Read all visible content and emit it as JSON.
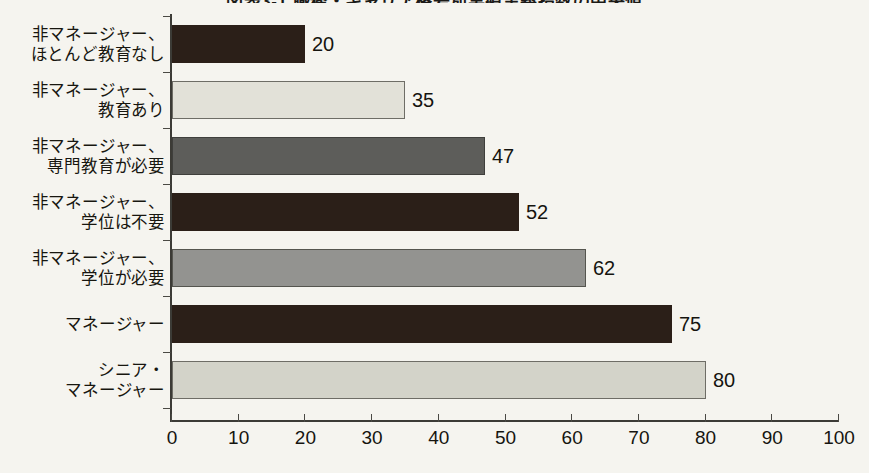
{
  "chart_data": {
    "type": "bar",
    "orientation": "horizontal",
    "title": "図表3-1 職務・キャリア格差別実績主義指数の中央値",
    "title_truncated": true,
    "xlabel": "",
    "ylabel": "",
    "xlim": [
      0,
      100
    ],
    "xticks": [
      "0",
      "10",
      "20",
      "30",
      "40",
      "50",
      "60",
      "70",
      "80",
      "90",
      "100"
    ],
    "grid": false,
    "legend": "none",
    "categories": [
      "非マネージャー、\nほとんど教育なし",
      "非マネージャー、\n教育あり",
      "非マネージャー、\n専門教育が必要",
      "非マネージャー、\n学位は不要",
      "非マネージャー、\n学位が必要",
      "マネージャー",
      "シニア・\nマネージャー"
    ],
    "values": [
      20,
      35,
      47,
      52,
      62,
      75,
      80
    ],
    "bars": [
      {
        "label_lines": [
          "非マネージャー、",
          "ほとんど教育なし"
        ],
        "value": 20,
        "value_label": "20",
        "fill": "#2b1f18",
        "stroke": "#2b1f18"
      },
      {
        "label_lines": [
          "非マネージャー、",
          "教育あり"
        ],
        "value": 35,
        "value_label": "35",
        "fill": "#e2e1d8",
        "stroke": "#6e6d66"
      },
      {
        "label_lines": [
          "非マネージャー、",
          "専門教育が必要"
        ],
        "value": 47,
        "value_label": "47",
        "fill": "#5d5d5a",
        "stroke": "#3f3f3c"
      },
      {
        "label_lines": [
          "非マネージャー、",
          "学位は不要"
        ],
        "value": 52,
        "value_label": "52",
        "fill": "#2b1f18",
        "stroke": "#2b1f18"
      },
      {
        "label_lines": [
          "非マネージャー、",
          "学位が必要"
        ],
        "value": 62,
        "value_label": "62",
        "fill": "#939390",
        "stroke": "#55554f"
      },
      {
        "label_lines": [
          "マネージャー"
        ],
        "value": 75,
        "value_label": "75",
        "fill": "#2b1f18",
        "stroke": "#2b1f18"
      },
      {
        "label_lines": [
          "シニア・",
          "マネージャー"
        ],
        "value": 80,
        "value_label": "80",
        "fill": "#d3d3c9",
        "stroke": "#6e6d66"
      }
    ],
    "colors": {
      "background": "#f5f4ef",
      "axis": "#3c3b36",
      "text": "#15140f"
    }
  }
}
